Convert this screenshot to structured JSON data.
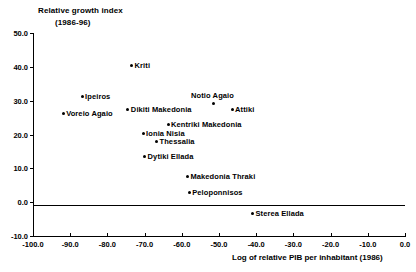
{
  "chart_data": {
    "type": "scatter",
    "title": "Relative growth index",
    "subtitle": "(1986-96)",
    "xlabel": "Log of relative PIB per inhabitant (1986)",
    "ylabel": "Relative growth index (1986-96)",
    "xlim": [
      -100.0,
      0.0
    ],
    "ylim": [
      -10.0,
      50.0
    ],
    "grid": false,
    "legend": null,
    "x_ticks": [
      "-100.0",
      "-90.0",
      "-80.0",
      "-70.0",
      "-60.0",
      "-50.0",
      "-40.0",
      "-30.0",
      "-20.0",
      "-10.0",
      "0.0"
    ],
    "x_tick_values": [
      -100.0,
      -90.0,
      -80.0,
      -70.0,
      -60.0,
      -50.0,
      -40.0,
      -30.0,
      -20.0,
      -10.0,
      0.0
    ],
    "y_ticks": [
      "50.0",
      "40.0",
      "30.0",
      "20.0",
      "10.0",
      "0.0",
      "-10.0"
    ],
    "y_tick_values": [
      50.0,
      40.0,
      30.0,
      20.0,
      10.0,
      0.0,
      -10.0
    ],
    "points": [
      {
        "label": "Kriti",
        "x": -73.5,
        "y": 40.5,
        "label_pos": "right"
      },
      {
        "label": "Ipeiros",
        "x": -86.8,
        "y": 31.2,
        "label_pos": "right"
      },
      {
        "label": "Notio Agaio",
        "x": -51.6,
        "y": 29.3,
        "label_pos": "above"
      },
      {
        "label": "Voreio Agaio",
        "x": -91.9,
        "y": 26.1,
        "label_pos": "right"
      },
      {
        "label": "Dikiti Makedonia",
        "x": -74.5,
        "y": 27.5,
        "label_pos": "right"
      },
      {
        "label": "Attiki",
        "x": -46.5,
        "y": 27.5,
        "label_pos": "right"
      },
      {
        "label": "Kentriki Makedonia",
        "x": -63.7,
        "y": 22.9,
        "label_pos": "right"
      },
      {
        "label": "Ionia Nisia",
        "x": -70.4,
        "y": 20.3,
        "label_pos": "right"
      },
      {
        "label": "Thessalia",
        "x": -66.8,
        "y": 17.8,
        "label_pos": "right"
      },
      {
        "label": "Dytiki Ellada",
        "x": -70.0,
        "y": 13.4,
        "label_pos": "right"
      },
      {
        "label": "Makedonia Thraki",
        "x": -58.5,
        "y": 7.6,
        "label_pos": "right"
      },
      {
        "label": "Peloponnisos",
        "x": -58.0,
        "y": 2.8,
        "label_pos": "right"
      },
      {
        "label": "Sterea Ellada",
        "x": -41.0,
        "y": -3.4,
        "label_pos": "right"
      }
    ]
  }
}
